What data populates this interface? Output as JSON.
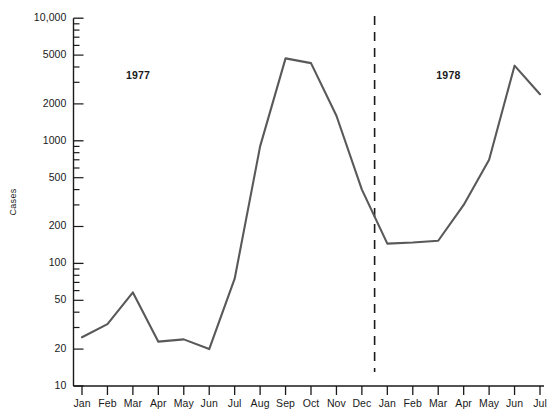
{
  "chart_data": {
    "type": "line",
    "title": "",
    "xlabel": "",
    "ylabel": "Cases",
    "yscale": "log",
    "ylim": [
      10,
      10000
    ],
    "grid": false,
    "legend": null,
    "categories": [
      "Jan",
      "Feb",
      "Mar",
      "Apr",
      "May",
      "Jun",
      "Jul",
      "Aug",
      "Sep",
      "Oct",
      "Nov",
      "Dec",
      "Jan",
      "Feb",
      "Mar",
      "Apr",
      "May",
      "Jun",
      "Jul"
    ],
    "values": [
      25,
      32,
      58,
      23,
      24,
      20,
      75,
      900,
      4700,
      4300,
      1600,
      400,
      145,
      148,
      153,
      300,
      700,
      4100,
      2400
    ],
    "ytick_labels": [
      "10,000",
      "5000",
      "2000",
      "1000",
      "500",
      "200",
      "100",
      "50",
      "20",
      "10"
    ],
    "ytick_values": [
      10000,
      5000,
      2000,
      1000,
      500,
      200,
      100,
      50,
      20,
      10
    ],
    "annotations": [
      {
        "text": "1977",
        "index": 2.2,
        "value": 3400
      },
      {
        "text": "1978",
        "index": 14.4,
        "value": 3400
      }
    ],
    "divider": {
      "type": "dashed-vertical",
      "between": [
        "Dec",
        "Jan"
      ],
      "index": 11.5
    },
    "colors": {
      "line": "#595959",
      "axis": "#1a1a1a",
      "text": "#1a1a1a",
      "divider": "#1a1a1a"
    }
  },
  "axis": {
    "y_title": "Cases"
  }
}
